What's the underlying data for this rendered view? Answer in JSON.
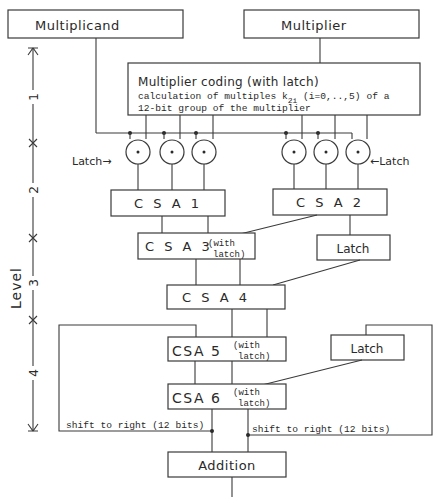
{
  "diagram": {
    "inputs": {
      "multiplicand": "Multiplicand",
      "multiplier": "Multiplier"
    },
    "coding_block": {
      "title": "Multiplier coding (with latch)",
      "line1": "calculation of multiples k",
      "subscript": "2i",
      "line1_rest": " (i=0,..,5) of a",
      "line2": "12-bit group of the multiplier"
    },
    "latch_label_left": "Latch→",
    "latch_label_right": "←Latch",
    "blocks": {
      "csa1": "C S A 1",
      "csa2": "C S A 2",
      "csa3": "C S A 3",
      "csa3_note1": "(with",
      "csa3_note2": "latch)",
      "latch_a": "Latch",
      "csa4": "C S A 4",
      "csa5": "CSA 5",
      "csa5_note1": "(with",
      "csa5_note2": "latch)",
      "latch_b": "Latch",
      "csa6": "CSA 6",
      "csa6_note1": "(with",
      "csa6_note2": "latch)",
      "addition": "Addition"
    },
    "feedback_labels": {
      "left": "shift to right (12 bits)",
      "right": "shift to right (12 bits)"
    },
    "level_axis": {
      "label": "Level",
      "levels": [
        "1",
        "2",
        "3",
        "4"
      ]
    }
  }
}
